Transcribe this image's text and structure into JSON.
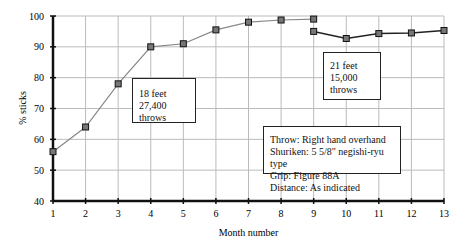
{
  "chart_data": {
    "type": "line",
    "title": "",
    "xlabel": "Month number",
    "ylabel": "% sticks",
    "xlim": [
      1,
      13
    ],
    "ylim": [
      40,
      100
    ],
    "x_ticks": [
      1,
      2,
      3,
      4,
      5,
      6,
      7,
      8,
      9,
      10,
      11,
      12,
      13
    ],
    "y_ticks": [
      40,
      50,
      60,
      70,
      80,
      90,
      100
    ],
    "grid": true,
    "series": [
      {
        "name": "18 feet, 27,400 throws",
        "x": [
          1,
          2,
          3,
          4,
          5,
          6,
          7,
          8,
          9
        ],
        "values": [
          56,
          64,
          78,
          90,
          91,
          95.5,
          98,
          98.7,
          99
        ],
        "color": "#888888"
      },
      {
        "name": "21 feet, 15,000 throws",
        "x": [
          9,
          10,
          11,
          12,
          13
        ],
        "values": [
          95,
          92.7,
          94.3,
          94.5,
          95.3
        ],
        "color": "#222222"
      }
    ],
    "annotations": [
      {
        "id": "box18",
        "lines": [
          "18 feet",
          "27,400 throws"
        ]
      },
      {
        "id": "box21",
        "lines": [
          "21 feet",
          "15,000",
          "throws"
        ]
      },
      {
        "id": "info",
        "lines": [
          "Throw: Right hand overhand",
          "Shuriken: 5 5/8\" negishi-ryu type",
          "Grip: Figure 88A",
          "Distance: As indicated"
        ]
      }
    ]
  }
}
